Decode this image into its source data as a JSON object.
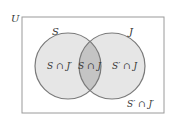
{
  "diagram": {
    "type": "venn",
    "universe_label": "U",
    "sets": [
      {
        "name": "S",
        "label": "S"
      },
      {
        "name": "J",
        "label": "J"
      }
    ],
    "regions": {
      "s_only": "S ∩ J′",
      "intersection": "S ∩ J",
      "j_only": "S′ ∩ J",
      "neither": "S′ ∩ J′"
    },
    "colors": {
      "circle_fill": "#e6e6e6",
      "intersection_fill": "#c4c4c4",
      "outline": "#7a7a7a",
      "border": "#9a9a9a",
      "text": "#333333"
    }
  }
}
